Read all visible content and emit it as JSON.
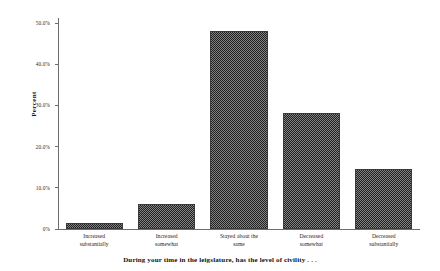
{
  "chart_data": {
    "type": "bar",
    "title": "",
    "subtitle": "",
    "xlabel": "During your time in the leigslature, has the level of civility . . .",
    "ylabel": "Percent",
    "categories": [
      "Increased substantially",
      "Increased somewhat",
      "Stayed about the same",
      "Decreased somewhat",
      "Decreased substantially"
    ],
    "category_lines": [
      [
        "Increased",
        "substantially"
      ],
      [
        "Increased",
        "somewhat"
      ],
      [
        "Stayed about the",
        "same"
      ],
      [
        "Decreased",
        "somewhat"
      ],
      [
        "Decreased",
        "substantially"
      ]
    ],
    "values": [
      1.5,
      6.1,
      48.0,
      28.2,
      14.6
    ],
    "ylim": [
      0,
      50
    ],
    "ytick_values": [
      0,
      10,
      20,
      30,
      40,
      50
    ],
    "ytick_labels": [
      "0%",
      "10.0%",
      "20.0%",
      "30.0%",
      "40.0%",
      "50.0%"
    ],
    "grid": false,
    "legend": false,
    "bar_color": "#4a4a4a",
    "bar_pattern": "dense-crosshatch",
    "axis_color": "#6d6d6d"
  },
  "figure": {
    "background": "#ffffff"
  }
}
